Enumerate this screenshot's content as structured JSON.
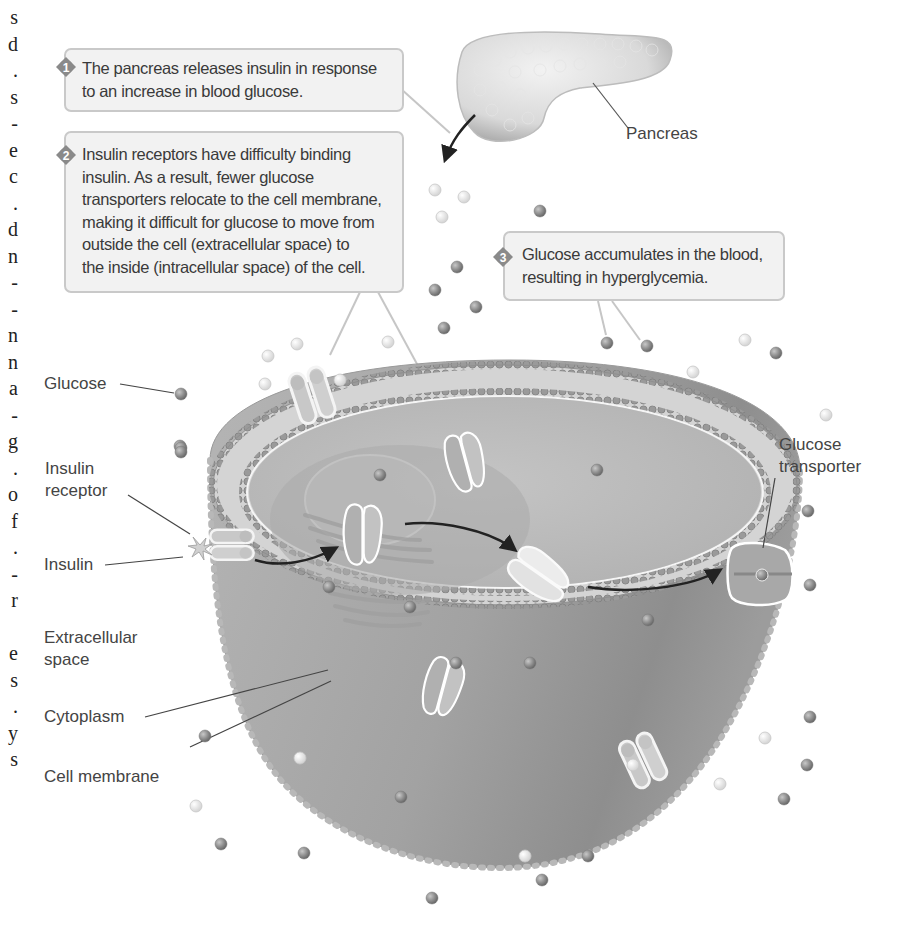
{
  "left_margin_fragments": [
    "s",
    "d",
    ".",
    "s",
    "-",
    "e",
    "c",
    ".",
    "d",
    "n",
    "-",
    "-",
    "n",
    "n",
    "a",
    "-",
    "g",
    ".",
    "o",
    "f",
    ".",
    "-",
    "r",
    "",
    "e",
    "s",
    ".",
    "y",
    "s"
  ],
  "callouts": [
    {
      "number": "1",
      "lines": [
        "The pancreas releases insulin in response",
        "to an increase in blood glucose."
      ]
    },
    {
      "number": "2",
      "lines": [
        "Insulin receptors have difficulty binding",
        "insulin.  As a result, fewer glucose",
        "transporters relocate to the cell membrane,",
        "making it difficult for glucose to move from",
        "outside the cell (extracellular space) to",
        "the inside (intracellular space) of the cell."
      ]
    },
    {
      "number": "3",
      "lines": [
        "Glucose accumulates in the blood,",
        "resulting in hyperglycemia."
      ]
    }
  ],
  "labels": {
    "pancreas": "Pancreas",
    "glucose": "Glucose",
    "insulin_receptor": [
      "Insulin",
      "receptor"
    ],
    "insulin": "Insulin",
    "extracellular_space": [
      "Extracellular",
      "space"
    ],
    "cytoplasm": "Cytoplasm",
    "cell_membrane": "Cell membrane",
    "glucose_transporter": [
      "Glucose",
      "transporter"
    ]
  },
  "colors": {
    "callout_fill": "#f2f2f2",
    "callout_border": "#c9c9c9",
    "badge_fill": "#8a8a8a",
    "glucose_dark": "#8c8c8c",
    "glucose_light": "#e4e4e4",
    "cell_outer": "#a8a8a8",
    "cytoplasm": "#bdbdbd",
    "membrane_band": "#d6d6d6",
    "text": "#444444"
  }
}
